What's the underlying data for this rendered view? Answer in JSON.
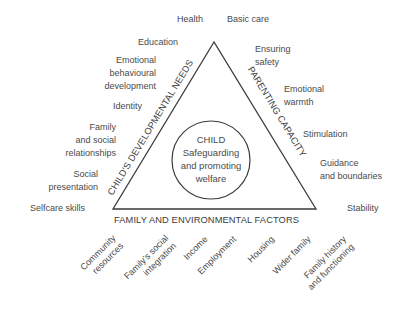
{
  "center": {
    "lines": [
      "CHILD",
      "Safeguarding",
      "and promoting",
      "welfare"
    ]
  },
  "sides": {
    "left": "CHILD'S DEVELOPMENTAL NEEDS",
    "right": "PARENTING CAPACITY",
    "bottom": "FAMILY AND ENVIRONMENTAL FACTORS"
  },
  "developmental_needs": [
    {
      "lines": [
        "Health"
      ]
    },
    {
      "lines": [
        "Education"
      ]
    },
    {
      "lines": [
        "Emotional",
        "behavioural",
        "development"
      ]
    },
    {
      "lines": [
        "Identity"
      ]
    },
    {
      "lines": [
        "Family",
        "and social",
        "relationships"
      ]
    },
    {
      "lines": [
        "Social",
        "presentation"
      ]
    },
    {
      "lines": [
        "Selfcare skills"
      ]
    }
  ],
  "parenting_capacity": [
    {
      "lines": [
        "Basic care"
      ]
    },
    {
      "lines": [
        "Ensuring",
        "safety"
      ]
    },
    {
      "lines": [
        "Emotional",
        "warmth"
      ]
    },
    {
      "lines": [
        "Stimulation"
      ]
    },
    {
      "lines": [
        "Guidance",
        "and boundaries"
      ]
    },
    {
      "lines": [
        "Stability"
      ]
    }
  ],
  "environmental_factors": [
    {
      "lines": [
        "Community",
        "resources"
      ]
    },
    {
      "lines": [
        "Family's social",
        "integration"
      ]
    },
    {
      "lines": [
        "Income"
      ]
    },
    {
      "lines": [
        "Employment"
      ]
    },
    {
      "lines": [
        "Housing"
      ]
    },
    {
      "lines": [
        "Wider family"
      ]
    },
    {
      "lines": [
        "Family history",
        "and functioning"
      ]
    }
  ],
  "colors": {
    "line": "#3a3a3a",
    "text": "#4a4a4a",
    "background": "#ffffff"
  }
}
